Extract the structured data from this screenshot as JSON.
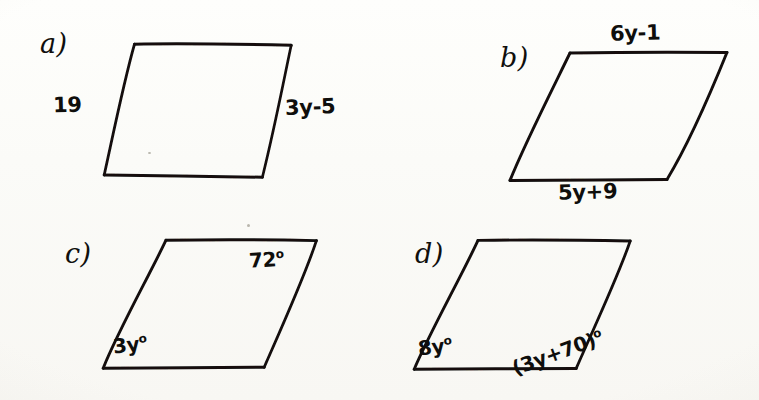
{
  "document": {
    "kind": "handwritten-geometry-worksheet",
    "description": "Four hand-drawn parallelograms labeled a) through d) with side length expressions and angle measures",
    "ink_color": "#14120f",
    "paper_color": "#fdfdfb"
  },
  "problems": [
    {
      "id": "a",
      "letter": "a)",
      "figure": "parallelogram",
      "labels": {
        "left_side": "19",
        "right_side": "3y-5"
      }
    },
    {
      "id": "b",
      "letter": "b)",
      "figure": "parallelogram",
      "labels": {
        "top_side": "6y-1",
        "bottom_side": "5y+9"
      }
    },
    {
      "id": "c",
      "letter": "c)",
      "figure": "parallelogram",
      "labels": {
        "top_right_angle": "72",
        "top_right_angle_unit": "o",
        "bottom_left_angle": "3y",
        "bottom_left_angle_unit": "o"
      }
    },
    {
      "id": "d",
      "letter": "d)",
      "figure": "parallelogram",
      "labels": {
        "bottom_left_angle": "8y",
        "bottom_left_angle_unit": "o",
        "bottom_right_angle": "(3y+70)",
        "bottom_right_angle_unit": "o"
      }
    }
  ]
}
